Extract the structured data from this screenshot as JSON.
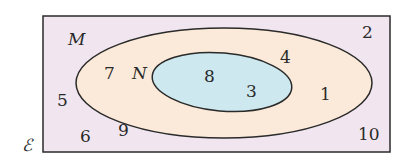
{
  "diagram": {
    "type": "venn",
    "universal_set": {
      "label": "ℰ",
      "fill": "#f1e6ef",
      "elements_outside": [
        "2",
        "5",
        "6",
        "9",
        "10"
      ]
    },
    "sets": [
      {
        "name": "M",
        "label": "M",
        "fill": "#fbead9",
        "elements_only": [
          "7",
          "4",
          "1"
        ]
      },
      {
        "name": "N",
        "label": "N",
        "fill": "#cde9ef",
        "subset_of": "M",
        "elements": [
          "8",
          "3"
        ]
      }
    ],
    "numbers": {
      "n2": "2",
      "n4": "4",
      "n7": "7",
      "n8": "8",
      "n3": "3",
      "n1": "1",
      "n5": "5",
      "n6": "6",
      "n9": "9",
      "n10": "10"
    }
  }
}
